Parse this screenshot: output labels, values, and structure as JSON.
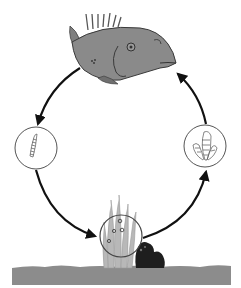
{
  "diagram": {
    "type": "life-cycle",
    "title": "",
    "stages": [
      {
        "id": "adult",
        "name": "adult-fish",
        "position": "top"
      },
      {
        "id": "larva",
        "name": "larva",
        "position": "left"
      },
      {
        "id": "eggs",
        "name": "eggs-on-seagrass",
        "position": "bottom"
      },
      {
        "id": "juvenile",
        "name": "juvenile",
        "position": "right"
      }
    ],
    "flow": [
      {
        "from": "adult",
        "to": "larva"
      },
      {
        "from": "larva",
        "to": "eggs"
      },
      {
        "from": "eggs",
        "to": "juvenile"
      },
      {
        "from": "juvenile",
        "to": "adult"
      }
    ],
    "colors": {
      "background": "#ffffff",
      "fish_body": "#8a8a8a",
      "fish_outline": "#3a3a3a",
      "arrow": "#111111",
      "circle_stroke": "#555555",
      "seabed": "#8c8c8c",
      "seagrass": "#b5b5b5",
      "rock": "#1e1e1e"
    }
  }
}
